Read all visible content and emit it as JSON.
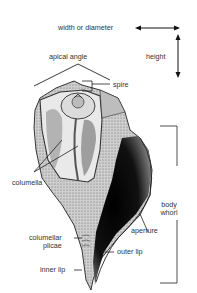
{
  "diagram": {
    "type": "shell-anatomy",
    "labels": {
      "width": "width or diameter",
      "height": "height",
      "apical_angle": "apical angle",
      "spire": "spire",
      "columella": "columella",
      "body_whorl_1": "body",
      "body_whorl_2": "whorl",
      "aperture": "aperture",
      "columellar_plicae_1": "columellar",
      "columellar_plicae_2": "plicae",
      "outer_lip": "outer lip",
      "inner_lip": "inner lip"
    },
    "colors": {
      "ink": "#1a1a1a",
      "shell_light": "#d9d9d9",
      "shell_mid": "#9a9a9a",
      "aperture_dark": "#0d0d0d",
      "background": "#ffffff"
    }
  }
}
